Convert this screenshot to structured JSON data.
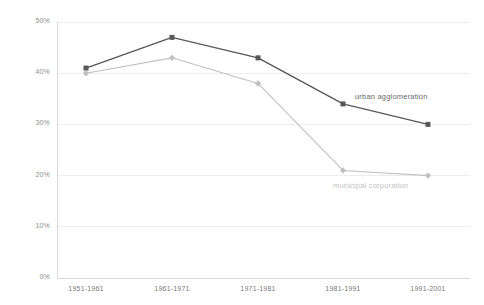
{
  "chart_data": {
    "type": "line",
    "title": "",
    "subtitle": "",
    "xlabel": "",
    "ylabel": "",
    "categories": [
      "1951-1961",
      "1961-1971",
      "1971-1981",
      "1981-1991",
      "1991-2001"
    ],
    "ylim": [
      0,
      50
    ],
    "ytick_labels": [
      "0%",
      "10%",
      "20%",
      "30%",
      "40%",
      "50%"
    ],
    "ytick_values": [
      0,
      10,
      20,
      30,
      40,
      50
    ],
    "grid": true,
    "grid_axis": "y",
    "legend_position": "inline-right-of-last-segment",
    "series": [
      {
        "name": "urban agglomeration",
        "values": [
          41,
          47,
          43,
          34,
          30
        ],
        "color": "#585858",
        "marker": "square",
        "label_x": 355,
        "label_y": 92
      },
      {
        "name": "municipal corporation",
        "values": [
          40,
          43,
          38,
          21,
          20
        ],
        "color": "#c0c0c0",
        "marker": "diamond",
        "label_x": 333,
        "label_y": 181
      }
    ]
  },
  "axes": {
    "y_axis_line_color": "#d8d8d8",
    "grid_color": "#ededed",
    "tick_text_color": "#8c8c8c"
  },
  "geometry": {
    "plot_left": 57,
    "plot_right": 470,
    "plot_top": 22,
    "plot_bottom": 278,
    "category_x": [
      86,
      172,
      258,
      343,
      428
    ]
  }
}
